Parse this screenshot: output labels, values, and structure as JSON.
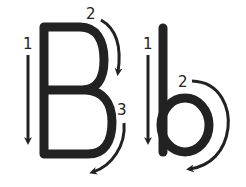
{
  "figure": {
    "letters": [
      {
        "glyph": "B",
        "strokes": [
          {
            "order": "1",
            "direction": "down"
          },
          {
            "order": "2",
            "direction": "clockwise-upper-bowl"
          },
          {
            "order": "3",
            "direction": "clockwise-lower-bowl"
          }
        ]
      },
      {
        "glyph": "b",
        "strokes": [
          {
            "order": "1",
            "direction": "down"
          },
          {
            "order": "2",
            "direction": "clockwise-bowl"
          }
        ]
      }
    ],
    "colors": {
      "ink": "#222222",
      "background": "#ffffff"
    }
  }
}
